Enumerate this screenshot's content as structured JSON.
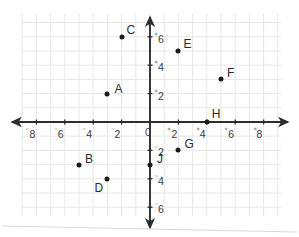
{
  "chart_data": {
    "type": "scatter",
    "title": "",
    "xlabel": "",
    "ylabel": "",
    "xlim": [
      -9,
      9
    ],
    "ylim": [
      -7,
      7
    ],
    "grid": true,
    "legend": "none",
    "x_ticks": [
      {
        "value": -8,
        "sign": "⁻",
        "text": "8"
      },
      {
        "value": -6,
        "sign": "⁻",
        "text": "6"
      },
      {
        "value": -4,
        "sign": "⁻",
        "text": "4"
      },
      {
        "value": -2,
        "sign": "⁻",
        "text": "2"
      },
      {
        "value": 0,
        "sign": "",
        "text": "0"
      },
      {
        "value": 2,
        "sign": "⁺",
        "text": "2"
      },
      {
        "value": 4,
        "sign": "⁺",
        "text": "4"
      },
      {
        "value": 6,
        "sign": "⁺",
        "text": "6"
      },
      {
        "value": 8,
        "sign": "⁺",
        "text": "8"
      }
    ],
    "y_ticks": [
      {
        "value": 6,
        "sign": "⁺",
        "text": "6"
      },
      {
        "value": 4,
        "sign": "⁺",
        "text": "4"
      },
      {
        "value": 2,
        "sign": "⁺",
        "text": "2"
      },
      {
        "value": -2,
        "sign": "⁻",
        "text": "2"
      },
      {
        "value": -4,
        "sign": "⁻",
        "text": "4"
      },
      {
        "value": -6,
        "sign": "⁻",
        "text": "6"
      }
    ],
    "points": [
      {
        "label": "A",
        "x": -3,
        "y": 2,
        "lx": 7,
        "ly": -11
      },
      {
        "label": "B",
        "x": -5,
        "y": -3,
        "lx": 6,
        "ly": -12
      },
      {
        "label": "C",
        "x": -2,
        "y": 6,
        "lx": 5,
        "ly": -13
      },
      {
        "label": "D",
        "x": -3,
        "y": -4,
        "lx": -13,
        "ly": 3
      },
      {
        "label": "E",
        "x": 2,
        "y": 5,
        "lx": 5,
        "ly": -13
      },
      {
        "label": "F",
        "x": 5,
        "y": 3,
        "lx": 6,
        "ly": -12
      },
      {
        "label": "G",
        "x": 2,
        "y": -2,
        "lx": 6,
        "ly": -12
      },
      {
        "label": "H",
        "x": 4,
        "y": 0,
        "lx": 5,
        "ly": -14
      },
      {
        "label": "J",
        "x": 0,
        "y": -3,
        "lx": 7,
        "ly": -12
      }
    ],
    "point_color": "#1a1a1a",
    "axis_color": "#2d2d2d",
    "grid_color": "#e6e6e6"
  },
  "geometry": {
    "origin_x": 150,
    "origin_y": 122,
    "unit": 14.2,
    "grid_left": 22,
    "grid_top": 14,
    "grid_right": 281,
    "grid_bottom": 216
  }
}
